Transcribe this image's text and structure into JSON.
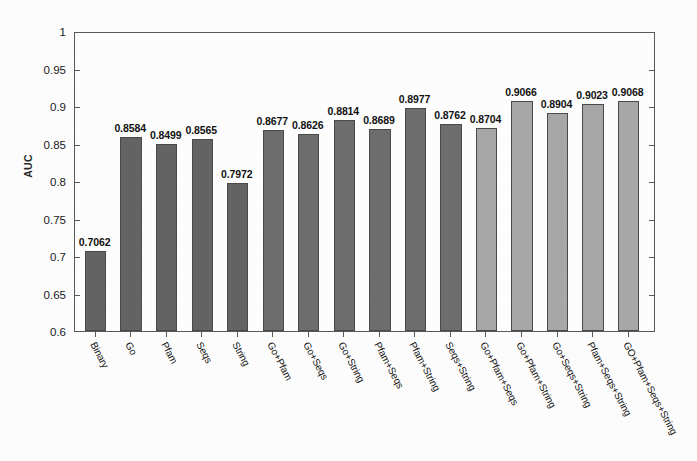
{
  "figure": {
    "background_color": "#ffffff",
    "frame_color": "#5a5a5a"
  },
  "axis": {
    "ylabel": "AUC",
    "yticks": [
      "0.6",
      "0.65",
      "0.7",
      "0.75",
      "0.8",
      "0.85",
      "0.9",
      "0.95",
      "1"
    ]
  },
  "chart_data": {
    "type": "bar",
    "title": "",
    "xlabel": "",
    "ylabel": "AUC",
    "ylim": [
      0.6,
      1.0
    ],
    "ytick_values": [
      0.6,
      0.65,
      0.7,
      0.75,
      0.8,
      0.85,
      0.9,
      0.95,
      1.0
    ],
    "grid": false,
    "legend": "none",
    "categories": [
      "Binary",
      "Go",
      "Pfam",
      "Seqs",
      "String",
      "Go+Pfam",
      "Go+Seqs",
      "Go+String",
      "Pfam+Seqs",
      "Pfam+String",
      "Seqs+String",
      "Go+Pfam+Seqs",
      "Go+Pfam+String",
      "Go+Seqs+String",
      "Pfam+Seqs+String",
      "GO+Pfam+Seqs+String"
    ],
    "values": [
      0.7062,
      0.8584,
      0.8499,
      0.8565,
      0.7972,
      0.8677,
      0.8626,
      0.8814,
      0.8689,
      0.8977,
      0.8762,
      0.8704,
      0.9066,
      0.8904,
      0.9023,
      0.9068
    ],
    "value_labels": [
      "0.7062",
      "0.8584",
      "0.8499",
      "0.8565",
      "0.7972",
      "0.8677",
      "0.8626",
      "0.8814",
      "0.8689",
      "0.8977",
      "0.8762",
      "0.8704",
      "0.9066",
      "0.8904",
      "0.9023",
      "0.9068"
    ],
    "bar_colors": [
      "#646464",
      "#646464",
      "#646464",
      "#646464",
      "#646464",
      "#6e6e6e",
      "#6e6e6e",
      "#6e6e6e",
      "#6e6e6e",
      "#6e6e6e",
      "#6e6e6e",
      "#a8a8a8",
      "#a8a8a8",
      "#a8a8a8",
      "#a8a8a8",
      "#a8a8a8"
    ]
  }
}
